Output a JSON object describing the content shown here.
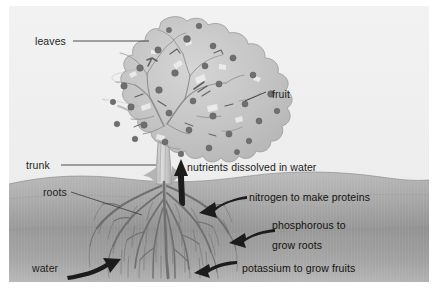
{
  "figure": {
    "background_color": "#ffffff",
    "panel_color": "#f0f0f0",
    "soil_color_top": "#a8a8a8",
    "soil_color_bottom": "#9a9a9a",
    "ink_color": "#231f20"
  },
  "labels": {
    "leaves": "leaves",
    "fruit": "fruit",
    "trunk": "trunk",
    "roots": "roots",
    "water": "water",
    "nutrients": "nutrients dissolved in water",
    "nitrogen": "nitrogen to make proteins",
    "phosphorous_line1": "phosphorous to",
    "phosphorous_line2": "grow roots",
    "potassium": "potassium to grow fruits"
  },
  "parts": {
    "canopy": "tree-canopy",
    "trunk": "tree-trunk",
    "roots": "tree-roots",
    "soil": "soil-layer",
    "sky": "sky-background"
  },
  "arrows": {
    "nutrients_up": "arrow-up-trunk",
    "nitrogen": "arrow-left-nitrogen",
    "phosphorous": "arrow-left-phosphorous",
    "potassium": "arrow-left-potassium",
    "water": "arrow-right-water"
  },
  "leader_lines": {
    "leaves": "leader-line-leaves",
    "fruit": "leader-line-fruit",
    "trunk": "leader-line-trunk",
    "roots": "leader-line-roots"
  }
}
